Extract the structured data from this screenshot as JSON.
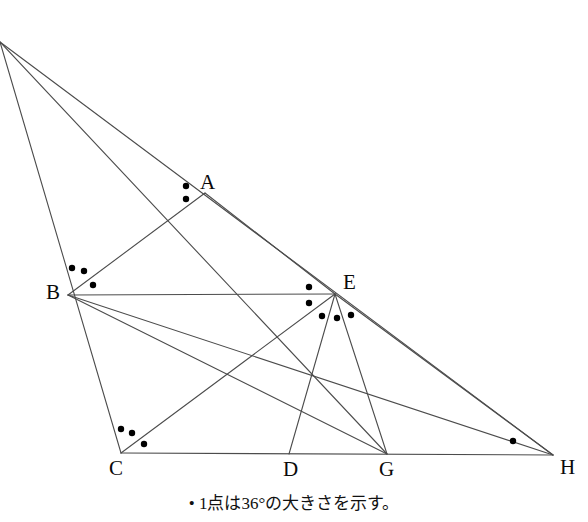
{
  "figure": {
    "caption": "• 1点は36°の大きさを示す。",
    "dot_value_degrees": 36,
    "stroke_color": "#4c4c4c",
    "dot_color": "#000000",
    "background_color": "#ffffff",
    "vertices": [
      {
        "name": "A",
        "label": "A",
        "x": 205,
        "y": 193,
        "label_x": 200,
        "label_y": 172
      },
      {
        "name": "B",
        "label": "B",
        "x": 68,
        "y": 295,
        "label_x": 46,
        "label_y": 282
      },
      {
        "name": "C",
        "label": "C",
        "x": 121,
        "y": 453,
        "label_x": 109,
        "label_y": 458
      },
      {
        "name": "D",
        "label": "D",
        "x": 289,
        "y": 454,
        "label_x": 283,
        "label_y": 459
      },
      {
        "name": "E",
        "label": "E",
        "x": 335,
        "y": 294,
        "label_x": 343,
        "label_y": 272
      },
      {
        "name": "G",
        "label": "G",
        "x": 387,
        "y": 454,
        "label_x": 379,
        "label_y": 459
      },
      {
        "name": "H",
        "label": "H",
        "x": 553,
        "y": 455,
        "label_x": 560,
        "label_y": 457
      },
      {
        "name": "apex",
        "label": "",
        "x": 0,
        "y": 42,
        "label_x": 0,
        "label_y": 0
      }
    ],
    "segments": [
      {
        "name": "apex-to-C",
        "x1": 0,
        "y1": 42,
        "x2": 121,
        "y2": 453
      },
      {
        "name": "apex-to-G",
        "x1": 0,
        "y1": 42,
        "x2": 387,
        "y2": 454
      },
      {
        "name": "apex-to-H",
        "x1": 0,
        "y1": 42,
        "x2": 553,
        "y2": 455
      },
      {
        "name": "B-to-A",
        "x1": 68,
        "y1": 295,
        "x2": 205,
        "y2": 193
      },
      {
        "name": "A-to-E",
        "x1": 205,
        "y1": 193,
        "x2": 335,
        "y2": 294
      },
      {
        "name": "B-to-E",
        "x1": 68,
        "y1": 295,
        "x2": 335,
        "y2": 294
      },
      {
        "name": "B-to-G",
        "x1": 68,
        "y1": 295,
        "x2": 387,
        "y2": 454
      },
      {
        "name": "B-to-H",
        "x1": 68,
        "y1": 295,
        "x2": 553,
        "y2": 455
      },
      {
        "name": "C-to-H",
        "x1": 121,
        "y1": 453,
        "x2": 553,
        "y2": 455
      },
      {
        "name": "C-to-E",
        "x1": 121,
        "y1": 453,
        "x2": 335,
        "y2": 294
      },
      {
        "name": "D-to-E",
        "x1": 289,
        "y1": 454,
        "x2": 335,
        "y2": 294
      },
      {
        "name": "E-to-G",
        "x1": 335,
        "y1": 294,
        "x2": 387,
        "y2": 454
      },
      {
        "name": "E-to-H",
        "x1": 335,
        "y1": 294,
        "x2": 553,
        "y2": 455
      }
    ],
    "angle_dots": [
      {
        "at": "A",
        "x": 186,
        "y": 186
      },
      {
        "at": "A",
        "x": 186,
        "y": 199
      },
      {
        "at": "B",
        "x": 72,
        "y": 268
      },
      {
        "at": "B",
        "x": 84,
        "y": 271
      },
      {
        "at": "B",
        "x": 93,
        "y": 285
      },
      {
        "at": "C",
        "x": 121,
        "y": 429
      },
      {
        "at": "C",
        "x": 132,
        "y": 433
      },
      {
        "at": "C",
        "x": 144,
        "y": 444
      },
      {
        "at": "E",
        "x": 309,
        "y": 287
      },
      {
        "at": "E",
        "x": 309,
        "y": 303
      },
      {
        "at": "E",
        "x": 322,
        "y": 316
      },
      {
        "at": "E",
        "x": 337,
        "y": 318
      },
      {
        "at": "E",
        "x": 351,
        "y": 315
      },
      {
        "at": "H",
        "x": 513,
        "y": 441
      }
    ],
    "angle_dot_counts": {
      "A": 2,
      "B": 3,
      "C": 3,
      "E": 5,
      "H": 1
    }
  }
}
